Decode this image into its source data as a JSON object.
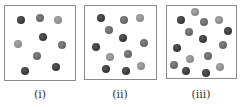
{
  "figure": {
    "colors": {
      "dark": "#3a3a3a",
      "medium": "#686868",
      "light": "#8e8e8e",
      "border": "#8a8a8a"
    },
    "panels": [
      {
        "label": "(i)",
        "box": {
          "x": 4,
          "y": 5,
          "w": 72,
          "h": 76
        },
        "label_x": 40,
        "balls": [
          {
            "x": 21,
            "y": 20,
            "shade": "dark"
          },
          {
            "x": 40,
            "y": 18,
            "shade": "medium"
          },
          {
            "x": 58,
            "y": 20,
            "shade": "light"
          },
          {
            "x": 43,
            "y": 37,
            "shade": "dark"
          },
          {
            "x": 18,
            "y": 44,
            "shade": "light"
          },
          {
            "x": 62,
            "y": 45,
            "shade": "medium"
          },
          {
            "x": 37,
            "y": 56,
            "shade": "medium"
          },
          {
            "x": 25,
            "y": 71,
            "shade": "dark"
          },
          {
            "x": 56,
            "y": 67,
            "shade": "dark"
          }
        ]
      },
      {
        "label": "(ii)",
        "box": {
          "x": 84,
          "y": 5,
          "w": 73,
          "h": 75
        },
        "label_x": 120,
        "balls": [
          {
            "x": 101,
            "y": 18,
            "shade": "dark"
          },
          {
            "x": 124,
            "y": 20,
            "shade": "medium"
          },
          {
            "x": 140,
            "y": 18,
            "shade": "light"
          },
          {
            "x": 109,
            "y": 30,
            "shade": "medium"
          },
          {
            "x": 123,
            "y": 38,
            "shade": "dark"
          },
          {
            "x": 144,
            "y": 43,
            "shade": "medium"
          },
          {
            "x": 96,
            "y": 47,
            "shade": "dark"
          },
          {
            "x": 110,
            "y": 57,
            "shade": "light"
          },
          {
            "x": 128,
            "y": 54,
            "shade": "medium"
          },
          {
            "x": 106,
            "y": 69,
            "shade": "dark"
          },
          {
            "x": 126,
            "y": 71,
            "shade": "dark"
          },
          {
            "x": 141,
            "y": 66,
            "shade": "light"
          }
        ]
      },
      {
        "label": "(iii)",
        "box": {
          "x": 166,
          "y": 5,
          "w": 71,
          "h": 74
        },
        "label_x": 201,
        "balls": [
          {
            "x": 195,
            "y": 12,
            "shade": "light"
          },
          {
            "x": 181,
            "y": 20,
            "shade": "dark"
          },
          {
            "x": 204,
            "y": 22,
            "shade": "medium"
          },
          {
            "x": 219,
            "y": 20,
            "shade": "light"
          },
          {
            "x": 189,
            "y": 32,
            "shade": "medium"
          },
          {
            "x": 228,
            "y": 31,
            "shade": "dark"
          },
          {
            "x": 203,
            "y": 39,
            "shade": "dark"
          },
          {
            "x": 223,
            "y": 45,
            "shade": "medium"
          },
          {
            "x": 177,
            "y": 48,
            "shade": "dark"
          },
          {
            "x": 190,
            "y": 59,
            "shade": "light"
          },
          {
            "x": 208,
            "y": 56,
            "shade": "medium"
          },
          {
            "x": 174,
            "y": 65,
            "shade": "medium"
          },
          {
            "x": 186,
            "y": 71,
            "shade": "dark"
          },
          {
            "x": 206,
            "y": 73,
            "shade": "dark"
          },
          {
            "x": 220,
            "y": 67,
            "shade": "light"
          }
        ]
      }
    ]
  }
}
